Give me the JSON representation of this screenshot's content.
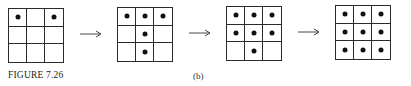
{
  "figure": {
    "caption": "FIGURE 7.26",
    "sub_label": "(b)"
  },
  "grids": [
    {
      "name": "step-1",
      "filled": [
        [
          1,
          0,
          1
        ],
        [
          0,
          0,
          0
        ],
        [
          0,
          0,
          0
        ]
      ],
      "left": 8,
      "top": 8
    },
    {
      "name": "step-2",
      "filled": [
        [
          1,
          1,
          1
        ],
        [
          0,
          1,
          0
        ],
        [
          0,
          1,
          0
        ]
      ],
      "left": 117,
      "top": 7
    },
    {
      "name": "step-3",
      "filled": [
        [
          1,
          1,
          1
        ],
        [
          1,
          1,
          1
        ],
        [
          0,
          1,
          0
        ]
      ],
      "left": 226,
      "top": 6
    },
    {
      "name": "step-4",
      "filled": [
        [
          1,
          1,
          1
        ],
        [
          1,
          1,
          1
        ],
        [
          1,
          1,
          1
        ]
      ],
      "left": 335,
      "top": 5
    }
  ],
  "arrows": [
    {
      "left": 80,
      "top": 30
    },
    {
      "left": 189,
      "top": 29
    },
    {
      "left": 298,
      "top": 28
    }
  ],
  "colors": {
    "line": "#2a2a2a",
    "dot": "#111111",
    "background": "#ffffff"
  }
}
